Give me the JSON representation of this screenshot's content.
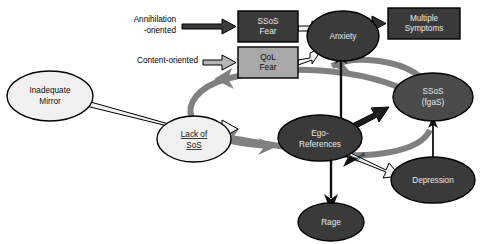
{
  "figure": {
    "type": "flow-diagram",
    "background": "#ffffff",
    "palette": {
      "dark_fill": "#3a3a3a",
      "mid_fill": "#4a4a4a",
      "light_fill": "#f0f0f0",
      "box_light_fill": "#a8a8a8",
      "gray_arrow": "#808080",
      "black_arrow": "#111111",
      "outline": "#000000"
    }
  },
  "labels": {
    "annihilation": "Annihilation",
    "annihilation2": "-oriented",
    "content": "Content-oriented",
    "time_label": "Time"
  },
  "nodes": [
    {
      "id": "inadequate-mirror",
      "label_line1": "Inadequate",
      "label_line2": "Mirror",
      "shape": "ellipse",
      "fill": "light",
      "text": "dark"
    },
    {
      "id": "ssos-fear",
      "label_line1": "SSoS",
      "label_line2": "Fear",
      "shape": "rect",
      "fill": "dark",
      "text": "light"
    },
    {
      "id": "qol-fear",
      "label_line1": "QoL",
      "label_line2": "Fear",
      "shape": "rect",
      "fill": "box_light",
      "text": "dark"
    },
    {
      "id": "anxiety",
      "label_line1": "Anxiety",
      "label_line2": "",
      "shape": "ellipse",
      "fill": "dark",
      "text": "light"
    },
    {
      "id": "multiple-symptoms",
      "label_line1": "Multiple",
      "label_line2": "Symptoms",
      "shape": "rect",
      "fill": "dark",
      "text": "light"
    },
    {
      "id": "ssos-fgas",
      "label_line1": "SSoS",
      "label_line2": "(fgaS)",
      "shape": "ellipse",
      "fill": "mid",
      "text": "light"
    },
    {
      "id": "lack-of-sos",
      "label_line1": "Lack of",
      "label_line2": "SoS",
      "shape": "ellipse",
      "fill": "light",
      "text": "dark",
      "underlined": true
    },
    {
      "id": "ego-references",
      "label_line1": "Ego-",
      "label_line2": "References",
      "shape": "ellipse",
      "fill": "dark",
      "text": "light"
    },
    {
      "id": "depression",
      "label_line1": "Depression",
      "label_line2": "",
      "shape": "ellipse",
      "fill": "dark",
      "text": "light"
    },
    {
      "id": "rage",
      "label_line1": "Rage",
      "label_line2": "",
      "shape": "ellipse",
      "fill": "dark",
      "text": "light"
    }
  ],
  "edges": [
    {
      "from": "annihilation-label",
      "to": "ssos-fear",
      "style": "black-outline-arrow"
    },
    {
      "from": "content-label",
      "to": "qol-fear",
      "style": "gray-outline-arrow"
    },
    {
      "from": "ssos-fear",
      "to": "anxiety",
      "style": "black-outline-arrow"
    },
    {
      "from": "qol-fear",
      "to": "anxiety",
      "style": "black-outline-arrow"
    },
    {
      "from": "anxiety",
      "to": "multiple-symptoms",
      "style": "black-outline-arrow"
    },
    {
      "from": "inadequate-mirror",
      "to": "lack-of-sos",
      "style": "black-outline-arrow"
    },
    {
      "from": "lack-of-sos",
      "to": "ego-references",
      "style": "black-outline-arrow"
    },
    {
      "from": "ego-references",
      "to": "anxiety",
      "style": "black-arrow"
    },
    {
      "from": "ego-references",
      "to": "ssos-fgas",
      "style": "black-outline-arrow"
    },
    {
      "from": "ego-references",
      "to": "rage",
      "style": "black-arrow"
    },
    {
      "from": "ego-references",
      "to": "depression",
      "style": "black-arrow",
      "label": "Time"
    },
    {
      "from": "ssos-fgas",
      "to": "depression",
      "style": "black-double-arrow"
    },
    {
      "from": "ssos-fgas",
      "to": "lack-of-sos",
      "style": "gray-curve-arrow"
    },
    {
      "from": "ssos-fgas",
      "to": "anxiety",
      "style": "gray-curve-arrow"
    },
    {
      "from": "depression",
      "to": "lack-of-sos",
      "style": "gray-curve-arrow"
    },
    {
      "from": "ego-references",
      "to": "lack-of-sos",
      "style": "gray-curve-arrow"
    }
  ]
}
